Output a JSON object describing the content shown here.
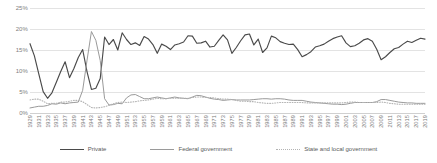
{
  "chart_data": {
    "type": "line",
    "title": "",
    "subtitle": "",
    "xlabel": "",
    "ylabel": "",
    "ylim": [
      0,
      25
    ],
    "ytick_labels": [
      "0%",
      "5%",
      "10%",
      "15%",
      "20%",
      "25%"
    ],
    "ytick_values": [
      0,
      5,
      10,
      15,
      20,
      25
    ],
    "grid": true,
    "legend_position": "bottom",
    "xlim": [
      1929,
      2019
    ],
    "x": [
      1929,
      1930,
      1931,
      1932,
      1933,
      1934,
      1935,
      1936,
      1937,
      1938,
      1939,
      1940,
      1941,
      1942,
      1943,
      1944,
      1945,
      1946,
      1947,
      1948,
      1949,
      1950,
      1951,
      1952,
      1953,
      1954,
      1955,
      1956,
      1957,
      1958,
      1959,
      1960,
      1961,
      1962,
      1963,
      1964,
      1965,
      1966,
      1967,
      1968,
      1969,
      1970,
      1971,
      1972,
      1973,
      1974,
      1975,
      1976,
      1977,
      1978,
      1979,
      1980,
      1981,
      1982,
      1983,
      1984,
      1985,
      1986,
      1987,
      1988,
      1989,
      1990,
      1991,
      1992,
      1993,
      1994,
      1995,
      1996,
      1997,
      1998,
      1999,
      2000,
      2001,
      2002,
      2003,
      2004,
      2005,
      2006,
      2007,
      2008,
      2009,
      2010,
      2011,
      2012,
      2013,
      2014,
      2015,
      2016,
      2017,
      2018,
      2019
    ],
    "xtick_labels": [
      "1929",
      "1931",
      "1933",
      "1935",
      "1937",
      "1939",
      "1941",
      "1943",
      "1945",
      "1947",
      "1949",
      "1951",
      "1953",
      "1955",
      "1957",
      "1959",
      "1961",
      "1963",
      "1965",
      "1967",
      "1969",
      "1971",
      "1973",
      "1975",
      "1977",
      "1979",
      "1981",
      "1983",
      "1985",
      "1987",
      "1989",
      "1991",
      "1993",
      "1995",
      "1997",
      "1999",
      "2001",
      "2003",
      "2005",
      "2007",
      "2009",
      "2011",
      "2013",
      "2015",
      "2017",
      "2019"
    ],
    "series": [
      {
        "name": "Private",
        "color": "#4a4a4a",
        "style": "solid",
        "values": [
          16.5,
          13.6,
          9.3,
          5.1,
          3.5,
          4.8,
          7.3,
          9.9,
          12.2,
          8.4,
          10.6,
          13.2,
          15.1,
          9.8,
          5.6,
          5.9,
          8.2,
          18.1,
          16.3,
          17.5,
          15.0,
          19.1,
          17.5,
          16.3,
          16.7,
          16.1,
          18.2,
          17.6,
          16.3,
          14.2,
          16.4,
          15.9,
          15.1,
          16.2,
          16.5,
          16.9,
          18.4,
          18.3,
          16.6,
          16.7,
          17.1,
          15.7,
          15.9,
          17.3,
          18.6,
          17.4,
          14.2,
          15.6,
          17.2,
          18.6,
          18.8,
          16.2,
          17.6,
          14.4,
          15.5,
          18.3,
          17.9,
          17.0,
          16.6,
          16.3,
          16.4,
          15.1,
          13.4,
          13.9,
          14.6,
          15.7,
          16.0,
          16.4,
          17.1,
          17.7,
          18.1,
          18.4,
          16.7,
          15.8,
          16.0,
          16.6,
          17.4,
          17.7,
          17.1,
          15.2,
          12.7,
          13.4,
          14.4,
          15.3,
          15.6,
          16.4,
          17.1,
          16.8,
          17.3,
          17.8,
          17.6
        ]
      },
      {
        "name": "Federal government",
        "color": "#9a9a9a",
        "style": "solid",
        "values": [
          1.2,
          1.4,
          1.6,
          1.6,
          1.8,
          2.2,
          2.1,
          2.4,
          2.2,
          2.4,
          2.5,
          2.6,
          5.4,
          12.6,
          19.4,
          17.3,
          12.5,
          3.4,
          1.9,
          2.0,
          2.3,
          2.2,
          3.6,
          4.3,
          4.4,
          3.9,
          3.4,
          3.4,
          3.6,
          3.8,
          3.6,
          3.4,
          3.6,
          3.8,
          3.6,
          3.5,
          3.4,
          3.8,
          4.2,
          4.1,
          3.8,
          3.5,
          3.3,
          3.2,
          3.0,
          3.1,
          3.2,
          3.1,
          3.1,
          3.1,
          3.1,
          3.2,
          3.3,
          3.4,
          3.4,
          3.3,
          3.4,
          3.4,
          3.3,
          3.1,
          3.0,
          3.0,
          3.0,
          2.8,
          2.6,
          2.5,
          2.4,
          2.3,
          2.2,
          2.1,
          2.1,
          2.0,
          2.1,
          2.3,
          2.5,
          2.5,
          2.5,
          2.5,
          2.5,
          2.7,
          3.2,
          3.2,
          3.0,
          2.8,
          2.6,
          2.5,
          2.4,
          2.4,
          2.3,
          2.3,
          2.3
        ]
      },
      {
        "name": "State and local government",
        "color": "#b3b3b3",
        "style": "dotted",
        "values": [
          3.1,
          3.3,
          3.3,
          2.8,
          2.2,
          2.3,
          2.3,
          2.6,
          2.6,
          2.8,
          3.0,
          3.0,
          2.7,
          2.0,
          1.3,
          1.2,
          1.3,
          1.5,
          1.8,
          2.2,
          2.5,
          2.6,
          2.5,
          2.6,
          2.7,
          2.9,
          3.0,
          3.1,
          3.3,
          3.5,
          3.4,
          3.4,
          3.5,
          3.5,
          3.5,
          3.5,
          3.5,
          3.7,
          3.8,
          3.8,
          3.7,
          3.7,
          3.6,
          3.4,
          3.3,
          3.3,
          3.2,
          3.0,
          2.8,
          2.8,
          2.7,
          2.7,
          2.5,
          2.4,
          2.3,
          2.3,
          2.4,
          2.5,
          2.5,
          2.5,
          2.5,
          2.5,
          2.5,
          2.4,
          2.4,
          2.4,
          2.4,
          2.4,
          2.4,
          2.4,
          2.4,
          2.4,
          2.5,
          2.6,
          2.6,
          2.5,
          2.5,
          2.5,
          2.5,
          2.5,
          2.6,
          2.5,
          2.3,
          2.2,
          2.1,
          2.1,
          2.1,
          2.1,
          2.1,
          2.1,
          2.1
        ]
      }
    ]
  },
  "legend": {
    "items": [
      {
        "label": "Private"
      },
      {
        "label": "Federal government"
      },
      {
        "label": "State and local government"
      }
    ]
  }
}
